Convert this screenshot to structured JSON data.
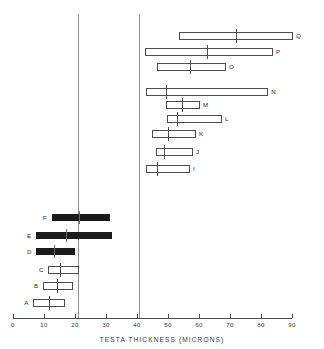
{
  "chart_data": {
    "type": "bar",
    "orientation": "horizontal",
    "title": "",
    "xlabel": "TESTA  THICKNESS  (MICRONS)",
    "ylabel": "",
    "xlim": [
      0,
      90
    ],
    "xticks": [
      0,
      10,
      20,
      30,
      40,
      50,
      60,
      70,
      80,
      90
    ],
    "xticklabels": [
      "0",
      "10",
      "20",
      "30",
      "40",
      "50",
      "60",
      "70",
      "80",
      "90"
    ],
    "grid": false,
    "legend": null,
    "reference_lines": [
      21,
      40.5
    ],
    "categories": [
      "A",
      "B",
      "C",
      "D",
      "E",
      "F",
      "I",
      "J",
      "K",
      "L",
      "M",
      "N",
      "O",
      "P",
      "Q"
    ],
    "bars": [
      {
        "label": "Q",
        "min": 53.5,
        "max": 90.3,
        "mean": 72.0,
        "style": "open",
        "row": 0
      },
      {
        "label": "P",
        "min": 42.6,
        "max": 83.9,
        "mean": 62.5,
        "style": "open",
        "row": 1
      },
      {
        "label": "O",
        "min": 46.5,
        "max": 68.7,
        "mean": 57.0,
        "style": "open",
        "row": 2
      },
      {
        "label": "N",
        "min": 43.0,
        "max": 82.3,
        "mean": 49.5,
        "style": "open",
        "row": 3
      },
      {
        "label": "M",
        "min": 49.5,
        "max": 60.3,
        "mean": 54.5,
        "style": "open",
        "row": 4
      },
      {
        "label": "L",
        "min": 49.7,
        "max": 67.4,
        "mean": 53.0,
        "style": "open",
        "row": 5
      },
      {
        "label": "K",
        "min": 44.8,
        "max": 59.0,
        "mean": 50.0,
        "style": "open",
        "row": 6
      },
      {
        "label": "J",
        "min": 46.1,
        "max": 58.1,
        "mean": 48.7,
        "style": "open",
        "row": 7
      },
      {
        "label": "I",
        "min": 42.9,
        "max": 57.1,
        "mean": 46.5,
        "style": "open",
        "row": 8
      },
      {
        "label": "F",
        "min": 12.6,
        "max": 31.3,
        "mean": 21.3,
        "style": "filled",
        "row": 10
      },
      {
        "label": "E",
        "min": 7.4,
        "max": 31.9,
        "mean": 17.1,
        "style": "filled",
        "row": 11
      },
      {
        "label": "D",
        "min": 7.4,
        "max": 20.0,
        "mean": 13.2,
        "style": "filled",
        "row": 12
      },
      {
        "label": "C",
        "min": 11.3,
        "max": 21.3,
        "mean": 15.2,
        "style": "open",
        "row": 13
      },
      {
        "label": "B",
        "min": 9.7,
        "max": 19.4,
        "mean": 14.2,
        "style": "open",
        "row": 14
      },
      {
        "label": "A",
        "min": 6.5,
        "max": 16.8,
        "mean": 11.6,
        "style": "open",
        "row": 15
      }
    ]
  }
}
